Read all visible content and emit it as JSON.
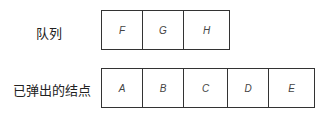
{
  "queue": {
    "label": "队列",
    "cells": [
      "F",
      "G",
      "H"
    ]
  },
  "popped": {
    "label": "已弹出的结点",
    "cells": [
      "A",
      "B",
      "C",
      "D",
      "E"
    ]
  }
}
